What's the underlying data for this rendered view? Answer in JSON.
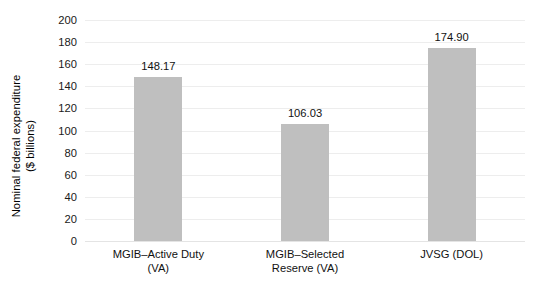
{
  "chart_data": {
    "type": "bar",
    "title": "",
    "subtitle": "",
    "xlabel": "",
    "ylabel": "Nominal federal expenditure ($ billions)",
    "ylabel_lines": [
      "Nominal federal expenditure",
      "($ billions)"
    ],
    "categories": [
      "MGIB–Active Duty (VA)",
      "MGIB–Selected Reserve (VA)",
      "JVSG (DOL)"
    ],
    "category_lines": [
      [
        "MGIB–Active Duty",
        "(VA)"
      ],
      [
        "MGIB–Selected",
        "Reserve (VA)"
      ],
      [
        "JVSG (DOL)",
        ""
      ]
    ],
    "values": [
      148.17,
      106.03,
      174.9
    ],
    "value_labels": [
      "148.17",
      "106.03",
      "174.90"
    ],
    "ylim": [
      0,
      200
    ],
    "yticks": [
      0,
      20,
      40,
      60,
      80,
      100,
      120,
      140,
      160,
      180,
      200
    ],
    "ytick_labels": [
      "0",
      "20",
      "40",
      "60",
      "80",
      "100",
      "120",
      "140",
      "160",
      "180",
      "200"
    ],
    "grid": true,
    "grid_axis": "y",
    "legend": false,
    "legend_position": "none",
    "bar_color": "#bfbfbf",
    "grid_color": "#ededed",
    "background_color": "#ffffff",
    "text_color": "#111111"
  }
}
